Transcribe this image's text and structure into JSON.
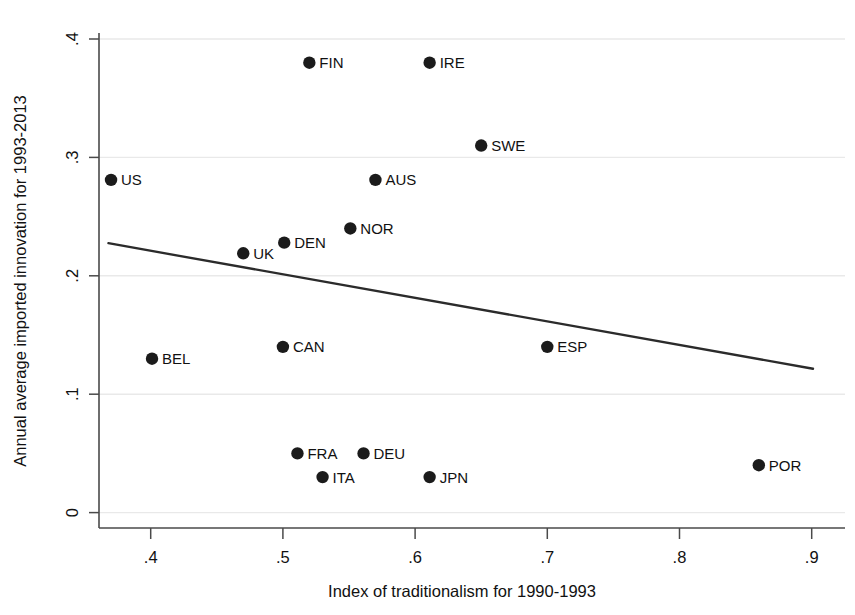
{
  "chart_data": {
    "type": "scatter",
    "title": "",
    "xlabel": "Index of traditionalism for 1990-1993",
    "ylabel": "Annual average imported innovation for 1993-2013",
    "xlim": [
      0.355,
      0.915
    ],
    "ylim": [
      0.0,
      0.41
    ],
    "xticks": [
      ".4",
      ".5",
      ".6",
      ".7",
      ".8",
      ".9"
    ],
    "xtick_values": [
      0.4,
      0.5,
      0.6,
      0.7,
      0.8,
      0.9
    ],
    "yticks": [
      "0",
      ".1",
      ".2",
      ".3",
      ".4"
    ],
    "ytick_values": [
      0,
      0.1,
      0.2,
      0.3,
      0.4
    ],
    "grid": "horizontal",
    "grid_color": "#e9e9e9",
    "marker_color": "#1b1b1b",
    "line_color": "#2b2b2b",
    "points": [
      {
        "label": "US",
        "x": 0.37,
        "y": 0.281,
        "label_side": "right"
      },
      {
        "label": "FIN",
        "x": 0.52,
        "y": 0.38,
        "label_side": "right"
      },
      {
        "label": "IRE",
        "x": 0.611,
        "y": 0.38,
        "label_side": "right"
      },
      {
        "label": "SWE",
        "x": 0.65,
        "y": 0.31,
        "label_side": "right"
      },
      {
        "label": "AUS",
        "x": 0.57,
        "y": 0.281,
        "label_side": "right"
      },
      {
        "label": "NOR",
        "x": 0.551,
        "y": 0.24,
        "label_side": "right"
      },
      {
        "label": "DEN",
        "x": 0.501,
        "y": 0.228,
        "label_side": "right"
      },
      {
        "label": "UK",
        "x": 0.47,
        "y": 0.219,
        "label_side": "right"
      },
      {
        "label": "BEL",
        "x": 0.401,
        "y": 0.13,
        "label_side": "right"
      },
      {
        "label": "CAN",
        "x": 0.5,
        "y": 0.14,
        "label_side": "right"
      },
      {
        "label": "ESP",
        "x": 0.7,
        "y": 0.14,
        "label_side": "right"
      },
      {
        "label": "FRA",
        "x": 0.511,
        "y": 0.05,
        "label_side": "right"
      },
      {
        "label": "DEU",
        "x": 0.561,
        "y": 0.05,
        "label_side": "right"
      },
      {
        "label": "ITA",
        "x": 0.53,
        "y": 0.03,
        "label_side": "right"
      },
      {
        "label": "JPN",
        "x": 0.611,
        "y": 0.03,
        "label_side": "right"
      },
      {
        "label": "POR",
        "x": 0.86,
        "y": 0.04,
        "label_side": "right"
      }
    ],
    "fit_line": {
      "x0": 0.368,
      "y0": 0.2275,
      "x1": 0.901,
      "y1": 0.1215
    }
  }
}
